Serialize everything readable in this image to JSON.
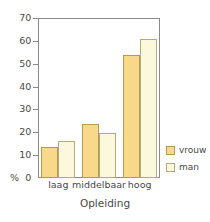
{
  "chart_data": {
    "type": "bar",
    "title": "",
    "xlabel": "Opleiding",
    "ylabel": "%",
    "categories": [
      "laag",
      "middelbaar",
      "hoog"
    ],
    "series": [
      {
        "name": "vrouw",
        "color": "#f8d98a",
        "values": [
          13.5,
          23.5,
          54
        ]
      },
      {
        "name": "man",
        "color": "#fcf8dc",
        "values": [
          16,
          19.5,
          61
        ]
      }
    ],
    "ylim": [
      0,
      70
    ],
    "ytick_step": 10,
    "yticks": [
      0,
      10,
      20,
      30,
      40,
      50,
      60,
      70
    ],
    "ytick_labels": [
      "0",
      "10",
      "20",
      "30",
      "40",
      "50",
      "60",
      "70"
    ],
    "grid": false,
    "legend_position": "lower-right-outside",
    "zero_label": "0",
    "percent_symbol": "%"
  }
}
